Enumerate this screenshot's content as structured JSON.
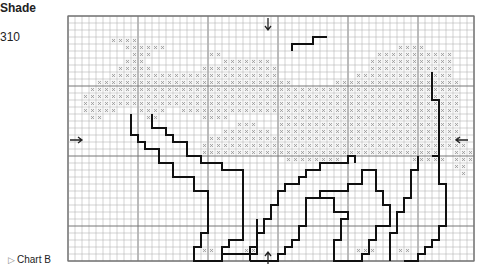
{
  "legend": {
    "title": "Shade",
    "shade_code": "310"
  },
  "footer": {
    "marker_icon": "triangle-right-outline",
    "label": "Chart B"
  },
  "grid": {
    "origin_x": 68,
    "origin_y": 16,
    "cell": 7,
    "cols": 58,
    "rows": 35,
    "major_every": 10,
    "minor_color": "#b5b5b5",
    "major_color": "#777777",
    "stitch_color": "#999999",
    "outline_color": "#111111"
  },
  "center_markers": {
    "top": {
      "x": 268,
      "y": 24,
      "glyph": "down-arrow"
    },
    "bottom": {
      "x": 268,
      "y": 258,
      "glyph": "up-arrow"
    },
    "left": {
      "x": 76,
      "y": 140,
      "glyph": "right-arrow"
    },
    "right": {
      "x": 462,
      "y": 140,
      "glyph": "left-arrow"
    }
  },
  "stitches": [
    "..........................................................",
    "..........................................................",
    "..........................................................",
    "......xxxx................................................",
    "........xxxxxx.................................xxxx........",
    ".........xxx........xx......................xxxxxxxxxxx....",
    "........xxx...........xxxxxxx..............xxxxxxxxxxxx....",
    ".......xxxxx.......xxxxxxxxxxx.............xxxxxxxxxxxx....",
    "......xxxxxxxxxxxxxxxxxxxxxxxx...........xxxxxxxxxxxxxx....",
    "....xxxxxxxxxxxxxxxxxxxxxxxxxxxx......xxxxxxxxxxxxxxxxxx...",
    "...xxxxxxxxxxxxxxxxxxxxxxxxxxxxxxxxxxxxxxxxxxxxxxxxxxxxx...",
    "..xxxxxxxxxxxxxxxxxxxxxxxxxxxxxxxxxxxxxxxxxxxxxxxxxxxxxx...",
    "..xxxxxxxxxxxxxxxxxxxxxxxxxxxxxxxxxxxxxxxxxxxxxxxxxxxxxx...",
    "..xxxxx...xxxx..xxxxxxxxxxxxxxxxxxxxxxxxxxxxxxxxxxxxxxxx...",
    "...xx......xx......xxxx.......xxxxxxxxxxxxxxxxxxxxxxxxxx...",
    "........................xxx...xxxxxxxxxxxxxxxxxxxxxxxxxx...",
    "......................xxxxxxx.xxxxxxxxxxxxxxxxxxxxxxxxxx...",
    "....................xxxxxxxxxxxxxxxxxxxxxxxxxxxxxxxxxxxx...",
    "...................xxxxxxxxxxxxxxxxxxxxxxxxxxxxxxxxxxxxxx..",
    "...................xxxxxxxxxxxxxxxxxxxxxxxxxxxxxxxxxx..xxx.",
    "...............................xxxxxxxx..........xxxxx.xxx.",
    ".......................................................xx..",
    "........................................................x.",
    "..........................................................",
    "..........................................................",
    "..........................................................",
    "..........................................................",
    "..........................................................",
    "..........................................................",
    "..........................................................",
    "..........................................................",
    "..........................................................",
    "..........................................................",
    "...................xx....xx..............xxx...xx.........",
    ".........................................................."
  ],
  "outlines": [
    {
      "name": "back-line",
      "points": [
        [
          32,
          5
        ],
        [
          32,
          4
        ],
        [
          35,
          4
        ],
        [
          35,
          3
        ],
        [
          37,
          3
        ]
      ]
    },
    {
      "name": "tail-line",
      "points": [
        [
          52,
          8
        ],
        [
          52,
          12
        ],
        [
          53,
          12
        ],
        [
          53,
          20
        ],
        [
          52,
          20
        ]
      ]
    },
    {
      "name": "front-leg-outline",
      "points": [
        [
          12,
          14
        ],
        [
          12,
          16
        ],
        [
          14,
          16
        ],
        [
          14,
          17
        ],
        [
          15,
          17
        ],
        [
          15,
          18
        ],
        [
          17,
          18
        ],
        [
          17,
          20
        ],
        [
          19,
          20
        ],
        [
          19,
          21
        ],
        [
          22,
          21
        ],
        [
          22,
          22
        ],
        [
          25,
          22
        ],
        [
          25,
          32
        ],
        [
          23,
          32
        ],
        [
          23,
          33
        ],
        [
          22,
          33
        ],
        [
          22,
          35
        ],
        [
          18,
          35
        ],
        [
          18,
          33
        ],
        [
          19,
          33
        ],
        [
          19,
          31
        ],
        [
          20,
          31
        ],
        [
          20,
          25
        ],
        [
          18,
          25
        ],
        [
          18,
          23
        ],
        [
          15,
          23
        ],
        [
          15,
          21
        ],
        [
          13,
          21
        ],
        [
          13,
          19
        ],
        [
          11,
          19
        ],
        [
          11,
          18
        ],
        [
          10,
          18
        ],
        [
          10,
          17
        ],
        [
          9,
          17
        ],
        [
          9,
          14
        ]
      ]
    },
    {
      "name": "front-leg-inner",
      "points": [
        [
          27,
          29
        ],
        [
          27,
          34
        ],
        [
          22,
          34
        ]
      ]
    },
    {
      "name": "mid-leg-outline",
      "points": [
        [
          26,
          35
        ],
        [
          30,
          35
        ],
        [
          30,
          34
        ],
        [
          31,
          34
        ],
        [
          31,
          33
        ],
        [
          32,
          33
        ],
        [
          32,
          32
        ],
        [
          33,
          32
        ],
        [
          33,
          30
        ],
        [
          34,
          30
        ],
        [
          34,
          26
        ],
        [
          36,
          26
        ],
        [
          36,
          25
        ],
        [
          40,
          25
        ],
        [
          40,
          24
        ],
        [
          42,
          24
        ],
        [
          42,
          22
        ],
        [
          44,
          22
        ],
        [
          44,
          25
        ],
        [
          45,
          25
        ],
        [
          45,
          27
        ],
        [
          46,
          27
        ],
        [
          46,
          30
        ],
        [
          44,
          30
        ],
        [
          44,
          32
        ],
        [
          43,
          32
        ],
        [
          43,
          34
        ],
        [
          42,
          34
        ],
        [
          42,
          35
        ],
        [
          38,
          35
        ],
        [
          38,
          32
        ],
        [
          39,
          32
        ],
        [
          39,
          29
        ],
        [
          40,
          29
        ],
        [
          40,
          28
        ],
        [
          38,
          28
        ],
        [
          38,
          26
        ],
        [
          36,
          26
        ]
      ]
    },
    {
      "name": "body-underline",
      "points": [
        [
          26,
          35
        ],
        [
          26,
          33
        ],
        [
          27,
          33
        ],
        [
          27,
          31
        ],
        [
          28,
          31
        ],
        [
          28,
          29
        ],
        [
          29,
          29
        ],
        [
          29,
          27
        ],
        [
          30,
          27
        ],
        [
          30,
          25
        ],
        [
          31,
          25
        ],
        [
          31,
          24
        ],
        [
          33,
          24
        ],
        [
          33,
          23
        ],
        [
          34,
          23
        ],
        [
          34,
          22
        ],
        [
          36,
          22
        ],
        [
          36,
          21
        ],
        [
          40,
          21
        ],
        [
          40,
          20
        ],
        [
          41,
          20
        ],
        [
          41,
          21
        ]
      ]
    },
    {
      "name": "hind-leg-outline",
      "points": [
        [
          48,
          35
        ],
        [
          50,
          35
        ],
        [
          50,
          34
        ],
        [
          51,
          34
        ],
        [
          51,
          33
        ],
        [
          52,
          33
        ],
        [
          52,
          32
        ],
        [
          53,
          32
        ],
        [
          53,
          30
        ],
        [
          54,
          30
        ],
        [
          54,
          24
        ],
        [
          53,
          24
        ],
        [
          53,
          20
        ]
      ]
    },
    {
      "name": "hind-leg-inner",
      "points": [
        [
          46,
          35
        ],
        [
          46,
          31
        ],
        [
          47,
          31
        ],
        [
          47,
          28
        ],
        [
          48,
          28
        ],
        [
          48,
          26
        ],
        [
          49,
          26
        ],
        [
          49,
          22
        ],
        [
          50,
          22
        ],
        [
          50,
          20
        ]
      ]
    }
  ]
}
